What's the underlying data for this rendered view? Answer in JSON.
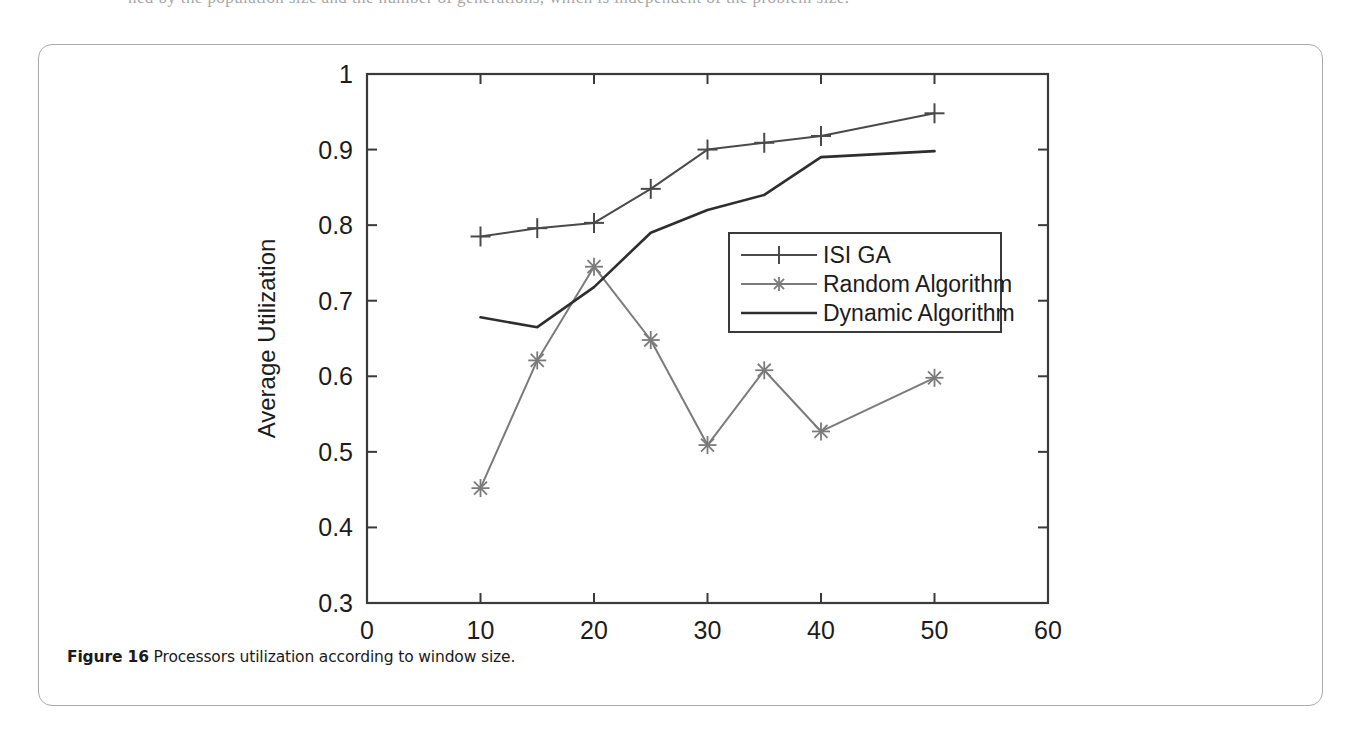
{
  "page": {
    "cropped_text_above": "ned by the population size and the number of generations, which is independent of the problem size."
  },
  "figure": {
    "caption_number": "Figure 16",
    "caption_text": "Processors utilization according to window size."
  },
  "colors": {
    "axis": "#3a3a3a",
    "isi_ga": "#4a4a4a",
    "random": "#7b7b7b",
    "dynamic": "#2e2e2e",
    "card_border": "#a9abad",
    "text": "#1c1c1c"
  },
  "chart_data": {
    "type": "line",
    "title": "",
    "xlabel": "Window Size",
    "ylabel": "Average Utilization",
    "xlim": [
      0,
      60
    ],
    "ylim": [
      0.3,
      1.0
    ],
    "xticks": [
      0,
      10,
      20,
      30,
      40,
      50,
      60
    ],
    "xtick_labels": [
      "0",
      "10",
      "20",
      "30",
      "40",
      "50",
      "60"
    ],
    "yticks": [
      0.3,
      0.4,
      0.5,
      0.6,
      0.7,
      0.8,
      0.9,
      1.0
    ],
    "ytick_labels": [
      "0.3",
      "0.4",
      "0.5",
      "0.6",
      "0.7",
      "0.8",
      "0.9",
      "1"
    ],
    "grid": false,
    "legend_position": "center-right",
    "x": [
      10,
      15,
      20,
      25,
      30,
      35,
      40,
      50
    ],
    "series": [
      {
        "name": "ISI GA",
        "marker": "plus",
        "color": "#4a4a4a",
        "values": [
          0.785,
          0.796,
          0.803,
          0.848,
          0.9,
          0.909,
          0.918,
          0.948
        ]
      },
      {
        "name": "Random Algorithm",
        "marker": "star",
        "color": "#7b7b7b",
        "values": [
          0.452,
          0.621,
          0.745,
          0.648,
          0.509,
          0.608,
          0.527,
          0.598
        ]
      },
      {
        "name": "Dynamic Algorithm",
        "marker": "none",
        "color": "#2e2e2e",
        "values": [
          0.678,
          0.665,
          0.718,
          0.79,
          0.82,
          0.84,
          0.89,
          0.898
        ]
      }
    ]
  }
}
